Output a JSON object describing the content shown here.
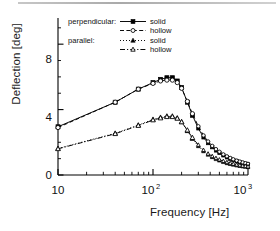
{
  "chart_data": {
    "type": "line",
    "title": "",
    "xlabel": "Frequency [Hz]",
    "ylabel": "Deflection [deg]",
    "xscale": "log",
    "xlim": [
      10,
      1000
    ],
    "ylim": [
      0,
      9.6
    ],
    "yticks": [
      0,
      4,
      8
    ],
    "ytick_labels": [
      "0",
      "4",
      "8"
    ],
    "xticks": [
      10,
      100,
      1000
    ],
    "xtick_labels": [
      "10",
      "10²",
      "10³"
    ],
    "grid": false,
    "legend_position": "top-left-inside",
    "series": [
      {
        "name": "perpendicular: solid",
        "group": "perpendicular",
        "marker": "filled-square",
        "line": "solid",
        "x": [
          10,
          40,
          70,
          100,
          120,
          140,
          160,
          180,
          200,
          230,
          260,
          300,
          340,
          380,
          420,
          460,
          500,
          550,
          600,
          650,
          700,
          760,
          820,
          880,
          940,
          1000
        ],
        "y": [
          2.95,
          4.45,
          5.25,
          5.65,
          5.85,
          5.95,
          5.95,
          5.75,
          5.35,
          4.45,
          3.65,
          2.85,
          2.3,
          1.95,
          1.7,
          1.5,
          1.35,
          1.2,
          1.08,
          0.99,
          0.92,
          0.84,
          0.78,
          0.73,
          0.69,
          0.65
        ]
      },
      {
        "name": "perpendicular: hollow",
        "group": "perpendicular",
        "marker": "open-circle",
        "line": "dashed",
        "x": [
          10,
          40,
          70,
          100,
          120,
          140,
          160,
          180,
          200,
          230,
          260,
          300,
          340,
          380,
          420,
          460,
          500,
          550,
          600,
          650,
          700,
          760,
          820,
          880,
          940,
          1000
        ],
        "y": [
          2.9,
          4.45,
          5.25,
          5.6,
          5.75,
          5.8,
          5.8,
          5.65,
          5.3,
          4.5,
          3.75,
          2.98,
          2.42,
          2.05,
          1.78,
          1.58,
          1.42,
          1.26,
          1.14,
          1.04,
          0.96,
          0.88,
          0.82,
          0.77,
          0.72,
          0.68
        ]
      },
      {
        "name": "parallel: solid",
        "group": "parallel",
        "marker": "filled-triangle",
        "line": "dotted",
        "x": [
          10,
          40,
          70,
          100,
          120,
          140,
          160,
          180,
          200,
          230,
          260,
          300,
          340,
          380,
          420,
          460,
          500,
          550,
          600,
          650,
          700,
          760,
          820,
          880,
          940,
          1000
        ],
        "y": [
          1.62,
          2.55,
          3.05,
          3.4,
          3.52,
          3.6,
          3.6,
          3.48,
          3.25,
          2.7,
          2.22,
          1.76,
          1.45,
          1.24,
          1.09,
          0.97,
          0.88,
          0.79,
          0.72,
          0.67,
          0.63,
          0.58,
          0.55,
          0.52,
          0.5,
          0.48
        ]
      },
      {
        "name": "parallel: hollow",
        "group": "parallel",
        "marker": "open-triangle",
        "line": "dash-dot",
        "x": [
          10,
          40,
          70,
          100,
          120,
          140,
          160,
          180,
          200,
          230,
          260,
          300,
          340,
          380,
          420,
          460,
          500,
          550,
          600,
          650,
          700,
          760,
          820,
          880,
          940,
          1000
        ],
        "y": [
          1.6,
          2.52,
          3.02,
          3.36,
          3.48,
          3.56,
          3.56,
          3.46,
          3.24,
          2.74,
          2.28,
          1.84,
          1.52,
          1.3,
          1.15,
          1.03,
          0.94,
          0.85,
          0.78,
          0.72,
          0.68,
          0.63,
          0.59,
          0.56,
          0.54,
          0.52
        ]
      }
    ],
    "legend": {
      "groups": [
        {
          "group_label": "perpendicular:",
          "entries": [
            {
              "label": "solid",
              "marker": "filled-square",
              "line": "solid"
            },
            {
              "label": "hollow",
              "marker": "open-circle",
              "line": "dashed"
            }
          ]
        },
        {
          "group_label": "parallel:",
          "entries": [
            {
              "label": "solid",
              "marker": "filled-triangle",
              "line": "dotted"
            },
            {
              "label": "hollow",
              "marker": "open-triangle",
              "line": "dash-dot"
            }
          ]
        }
      ]
    },
    "colors": {
      "line": "#000000",
      "marker_fill": "#000000",
      "marker_open": "#ffffff",
      "axis": "#000000"
    }
  },
  "axes": {
    "y_title": "Deflection [deg]",
    "x_title": "Frequency [Hz]",
    "ytick_0": "0",
    "ytick_4": "4",
    "ytick_8": "8",
    "xtick_10": "10",
    "xtick_100": "10",
    "xtick_100_exp": "2",
    "xtick_1000": "10",
    "xtick_1000_exp": "3"
  },
  "legend_text": {
    "group1": "perpendicular:",
    "group1_e1": "solid",
    "group1_e2": "hollow",
    "group2": "parallel:",
    "group2_e1": "solid",
    "group2_e2": "hollow"
  }
}
